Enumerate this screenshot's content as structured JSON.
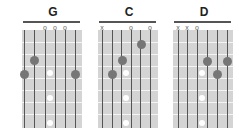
{
  "chords": [
    {
      "name": "G",
      "markers": [
        "",
        "",
        "o",
        "o",
        "o",
        ""
      ]
    },
    {
      "name": "C",
      "markers": [
        "x",
        "",
        "",
        "o",
        "",
        "o"
      ]
    },
    {
      "name": "D",
      "markers": [
        "x",
        "x",
        "o",
        "",
        "",
        ""
      ]
    }
  ],
  "colors": {
    "board": "#d4d4d4",
    "string": "#555555",
    "dot": "#767676",
    "inlay": "#ffffff"
  }
}
